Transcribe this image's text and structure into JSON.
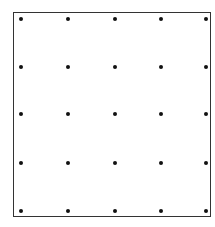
{
  "diagram": {
    "type": "dot-grid",
    "rows": 5,
    "cols": 5,
    "dot_color": "#111111",
    "border_color": "#333333",
    "dots_x": [
      21,
      68,
      115,
      161,
      206
    ],
    "dots_y": [
      19,
      67,
      114,
      163,
      211
    ]
  }
}
